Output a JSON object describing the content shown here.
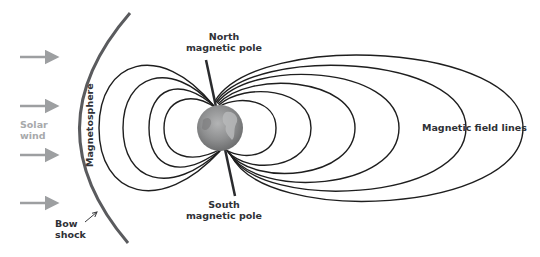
{
  "diagram": {
    "labels": {
      "north_pole_line1": "North",
      "north_pole_line2": "magnetic pole",
      "south_pole_line1": "South",
      "south_pole_line2": "magnetic pole",
      "solar_wind_line1": "Solar",
      "solar_wind_line2": "wind",
      "magnetosphere": "Magnetosphere",
      "bow_shock_line1": "Bow",
      "bow_shock_line2": "shock",
      "field_lines": "Magnetic field lines"
    },
    "colors": {
      "field_line": "#1e1e1e",
      "bow_shock": "#5a5b5e",
      "solar_wind_arrow": "#9d9fa1",
      "earth": "#8f9091",
      "text_dark": "#2f3136",
      "text_grey": "#a7a9ab"
    },
    "solar_wind_arrows": 4,
    "left_field_loops": 4,
    "right_field_loops": 6
  }
}
